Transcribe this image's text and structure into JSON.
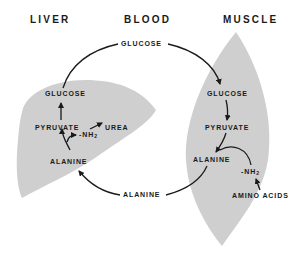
{
  "headers": {
    "liver": "LIVER",
    "blood": "BLOOD",
    "muscle": "MUSCLE"
  },
  "blood": {
    "glucose": "GLUCOSE",
    "alanine": "ALANINE"
  },
  "liver": {
    "glucose": "GLUCOSE",
    "pyruvate": "PYRUVATE",
    "urea": "UREA",
    "nh2": "-NH",
    "nh2_sub": "2",
    "alanine": "ALANINE"
  },
  "muscle": {
    "glucose": "GLUCOSE",
    "pyruvate": "PYRUVATE",
    "alanine": "ALANINE",
    "nh2": "-NH",
    "nh2_sub": "2",
    "amino_acids": "AMINO ACIDS"
  },
  "colors": {
    "organ_fill": "#cfcfcf",
    "ink": "#1a1a1a",
    "background": "#ffffff"
  }
}
